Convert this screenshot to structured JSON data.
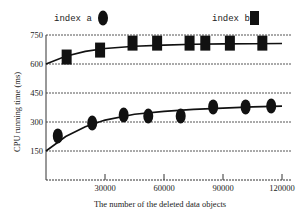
{
  "chart_data": {
    "type": "line",
    "title": "",
    "xlabel": "The number of the deleted data objects",
    "ylabel": "CPU running time (ms)",
    "xlim": [
      0,
      120000
    ],
    "ylim": [
      0,
      750
    ],
    "x_ticks": [
      30000,
      60000,
      90000,
      120000
    ],
    "x_tick_labels": [
      "30000",
      "60000",
      "90000",
      "120000"
    ],
    "y_ticks": [
      150,
      300,
      450,
      600,
      750
    ],
    "y_tick_labels": [
      "150",
      "300",
      "450",
      "600",
      "750"
    ],
    "grid": "horizontal dashed",
    "legend_position": "top",
    "series": [
      {
        "name": "index a",
        "marker": "ellipse",
        "color": "#111111",
        "points": [
          {
            "x": 6000,
            "y": 228
          },
          {
            "x": 23500,
            "y": 295
          },
          {
            "x": 39500,
            "y": 336
          },
          {
            "x": 52000,
            "y": 331
          },
          {
            "x": 68500,
            "y": 331
          },
          {
            "x": 85000,
            "y": 378
          },
          {
            "x": 101500,
            "y": 378
          },
          {
            "x": 114500,
            "y": 383
          }
        ],
        "fit_curve": {
          "x": [
            0,
            10000,
            20000,
            30000,
            45000,
            60000,
            75000,
            90000,
            105000,
            120000
          ],
          "y": [
            150,
            225,
            275,
            310,
            340,
            355,
            365,
            372,
            378,
            382
          ]
        }
      },
      {
        "name": "index b",
        "marker": "square",
        "color": "#111111",
        "points": [
          {
            "x": 10500,
            "y": 636
          },
          {
            "x": 27500,
            "y": 672
          },
          {
            "x": 44000,
            "y": 708
          },
          {
            "x": 56500,
            "y": 708
          },
          {
            "x": 73000,
            "y": 708
          },
          {
            "x": 81000,
            "y": 708
          },
          {
            "x": 93500,
            "y": 708
          },
          {
            "x": 110000,
            "y": 708
          }
        ],
        "fit_curve": {
          "x": [
            0,
            10000,
            20000,
            30000,
            45000,
            60000,
            75000,
            90000,
            105000,
            120000
          ],
          "y": [
            600,
            640,
            665,
            680,
            692,
            698,
            702,
            704,
            705,
            706
          ]
        }
      }
    ]
  },
  "legend": {
    "a_label": "index a",
    "b_label": "index b"
  },
  "axes": {
    "xlabel": "The number of the deleted data objects",
    "ylabel": "CPU running time (ms)"
  }
}
